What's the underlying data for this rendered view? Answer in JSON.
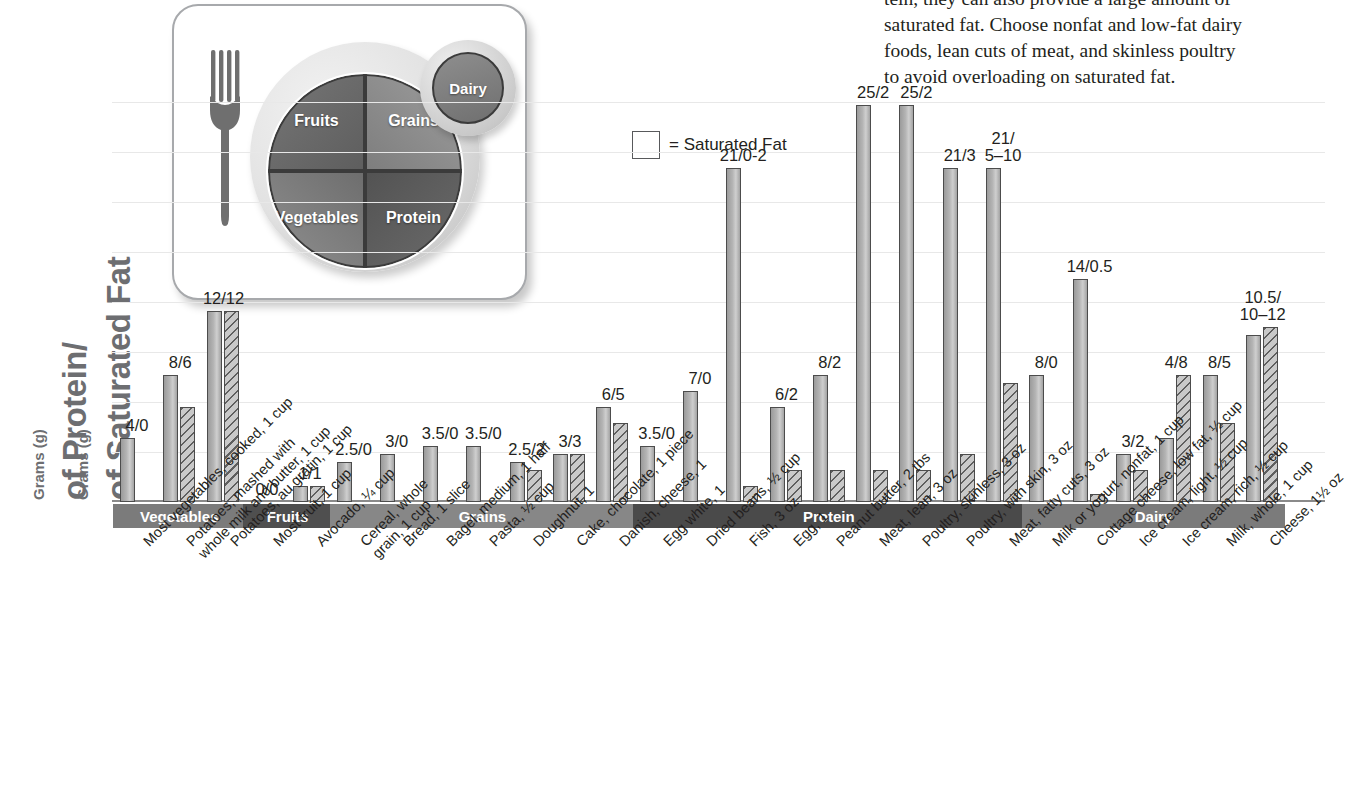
{
  "yaxis": {
    "unit_label_1": "Grams (g)",
    "title_1": "of Protein/",
    "unit_label_2": "Grams (g)",
    "title_2": "of Saturated Fat"
  },
  "plate": {
    "fork_icon": "fork-icon",
    "segments": [
      {
        "name": "fruits",
        "label": "Fruits"
      },
      {
        "name": "grains",
        "label": "Grains"
      },
      {
        "name": "vegetables",
        "label": "Vegetables"
      },
      {
        "name": "protein",
        "label": "Protein"
      }
    ],
    "dairy_label": "Dairy"
  },
  "body_text": {
    "clipped_first_line": "",
    "line_1": "tein, they can also provide a large amount of",
    "line_2": "saturated fat. Choose nonfat and low-fat dairy",
    "line_3": "foods, lean cuts of meat, and skinless poultry",
    "line_4": "to avoid overloading on saturated fat."
  },
  "legend": {
    "swatch_icon": "hatched-square-icon",
    "text": "= Saturated Fat"
  },
  "colors": {
    "protein_bar": "#b4b4b4",
    "satfat_bar": "#c9c9c9",
    "hatch_stroke": "#5f5f5f",
    "bar_outline": "#4c4c4c",
    "baseline": "#8a8a8a",
    "gridline": "#e8e8e8",
    "axis_title": "#6d6e71",
    "band_vegetables": "#7b7b7b",
    "band_fruits": "#4f4f4f",
    "band_grains": "#878787",
    "band_protein": "#4a4a4a",
    "band_dairy": "#7b7b7b",
    "text": "#231f20"
  },
  "chart_data": {
    "type": "bar",
    "title": "",
    "xlabel": "",
    "ylabel": "Grams (g) of Protein/Grams (g) of Saturated Fat",
    "grid": true,
    "gridline_count": 8,
    "legend_position": "top-center",
    "ylim": [
      0,
      27
    ],
    "series": [
      {
        "name": "Protein (g)",
        "style": "solid",
        "values": [
          4,
          8,
          12,
          0,
          1,
          2.5,
          3,
          3.5,
          3.5,
          2.5,
          3,
          6,
          3.5,
          7,
          21,
          6,
          8,
          25,
          25,
          21,
          21,
          8,
          14,
          3,
          4,
          8,
          10.5
        ]
      },
      {
        "name": "Saturated Fat (g)",
        "style": "hatched",
        "values": [
          0,
          6,
          12,
          0,
          1,
          0,
          0,
          0,
          0,
          2,
          3,
          5,
          0,
          0,
          1,
          2,
          2,
          2,
          2,
          3,
          7.5,
          0,
          0.5,
          2,
          8,
          5,
          11
        ]
      }
    ],
    "categories": [
      "Most vegetables, cooked, 1 cup",
      "Potatoes, mashed with\nwhole milk and butter, 1 cup",
      "Potatoes, au gratin, 1 cup",
      "Most fruit, 1 cup",
      "Avocado, ¼ cup",
      "Cereal, whole\ngrain, 1 cup",
      "Bread, 1 slice",
      "Bagel, medium, 1 half",
      "Pasta, ½ cup",
      "Doughnut, 1",
      "Cake, chocolate, 1 piece",
      "Danish, cheese, 1",
      "Egg white, 1",
      "Dried beans, ½ cup",
      "Fish, 3 oz",
      "Egg, 1",
      "Peanut butter, 2 tbs",
      "Meat, lean, 3 oz",
      "Poultry, skinless, 3 oz",
      "Poultry, with skin, 3 oz",
      "Meat, fatty cuts, 3 oz",
      "Milk or yogurt, nonfat, 1 cup",
      "Cottage cheese, low fat, ½ cup",
      "Ice cream, light, ½ cup",
      "Ice cream, rich, ½ cup",
      "Milk, whole, 1 cup",
      "Cheese, 1½ oz"
    ],
    "value_labels": [
      "4/0",
      "8/6",
      "12/12",
      "0/0",
      "1/1",
      "2.5/0",
      "3/0",
      "3.5/0",
      "3.5/0",
      "2.5/2",
      "3/3",
      "6/5",
      "3.5/0",
      "7/0",
      "21/0-2",
      "6/2",
      "8/2",
      "25/2",
      "25/2",
      "21/3",
      "21/\n5–10",
      "8/0",
      "14/0.5",
      "3/2",
      "4/8",
      "8/5",
      "10.5/\n10–12"
    ],
    "groups": [
      {
        "label": "Vegetables",
        "start_index": 0,
        "end_index": 2
      },
      {
        "label": "Fruits",
        "start_index": 3,
        "end_index": 4
      },
      {
        "label": "Grains",
        "start_index": 5,
        "end_index": 11
      },
      {
        "label": "Protein",
        "start_index": 12,
        "end_index": 20
      },
      {
        "label": "Dairy",
        "start_index": 21,
        "end_index": 26
      }
    ]
  }
}
